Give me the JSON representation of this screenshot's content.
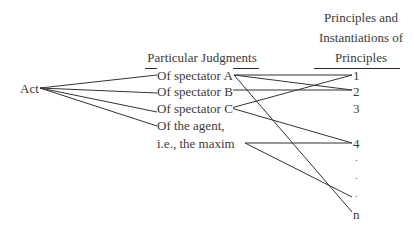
{
  "diagram": {
    "source_node": "Act",
    "headers": {
      "judgments": "Particular Judgments",
      "principles_line1": "Principles and",
      "principles_line2": "Instantiations of",
      "principles_line3": "Principles"
    },
    "judgments": [
      "Of spectator A",
      "Of spectator B",
      "Of spectator C",
      "Of the agent,",
      "i.e., the maxim"
    ],
    "principles": [
      "1",
      "2",
      "3",
      "4",
      ".",
      ".",
      ".",
      "n"
    ],
    "edges": [
      {
        "from": "Act",
        "to": "Of spectator A"
      },
      {
        "from": "Act",
        "to": "Of spectator B"
      },
      {
        "from": "Act",
        "to": "Of spectator C"
      },
      {
        "from": "Act",
        "to": "Of the agent, i.e., the maxim"
      },
      {
        "from": "Of spectator A",
        "to": "1"
      },
      {
        "from": "Of spectator A",
        "to": "2"
      },
      {
        "from": "Of spectator A",
        "to": "n"
      },
      {
        "from": "Of spectator B",
        "to": "2"
      },
      {
        "from": "Of spectator C",
        "to": "1"
      },
      {
        "from": "Of spectator C",
        "to": "4"
      },
      {
        "from": "the maxim",
        "to": "4"
      },
      {
        "from": "the maxim",
        "to": "."
      }
    ]
  }
}
